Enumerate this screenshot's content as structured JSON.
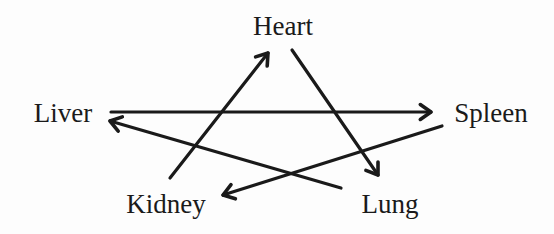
{
  "diagram": {
    "type": "directed-graph",
    "nodes": [
      {
        "id": "heart",
        "label": "Heart",
        "x": 283,
        "y": 35
      },
      {
        "id": "liver",
        "label": "Liver",
        "x": 63,
        "y": 122
      },
      {
        "id": "spleen",
        "label": "Spleen",
        "x": 491,
        "y": 122
      },
      {
        "id": "kidney",
        "label": "Kidney",
        "x": 166,
        "y": 213
      },
      {
        "id": "lung",
        "label": "Lung",
        "x": 390,
        "y": 213
      }
    ],
    "edges": [
      {
        "from": "kidney",
        "to": "heart",
        "x1": 170,
        "y1": 178,
        "x2": 268,
        "y2": 53
      },
      {
        "from": "heart",
        "to": "lung",
        "x1": 292,
        "y1": 50,
        "x2": 378,
        "y2": 175
      },
      {
        "from": "liver",
        "to": "spleen",
        "x1": 111,
        "y1": 112,
        "x2": 431,
        "y2": 112
      },
      {
        "from": "lung",
        "to": "liver",
        "x1": 341,
        "y1": 188,
        "x2": 110,
        "y2": 121
      },
      {
        "from": "spleen",
        "to": "kidney",
        "x1": 442,
        "y1": 126,
        "x2": 223,
        "y2": 195
      }
    ],
    "colors": {
      "stroke": "#1a1a1a",
      "text": "#1a1a1a",
      "background": "#fdfdfd"
    }
  }
}
